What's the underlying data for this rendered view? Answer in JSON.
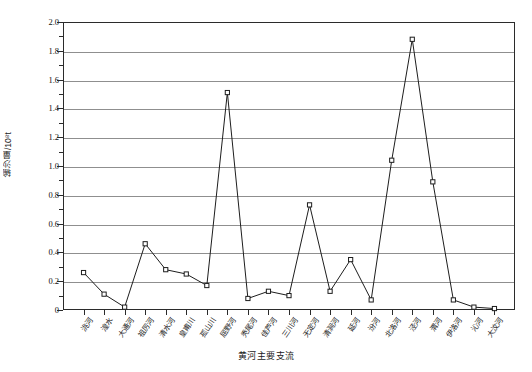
{
  "chart_data": {
    "type": "line",
    "title": "",
    "xlabel": "黄河主要支流",
    "ylabel": "输沙量/10⁸t",
    "ylim": [
      0,
      2.0
    ],
    "yticks": [
      "0",
      "0.2",
      "0.4",
      "0.6",
      "0.8",
      "1.0",
      "1.2",
      "1.4",
      "1.6",
      "1.8",
      "2.0"
    ],
    "ytick_values": [
      0,
      0.2,
      0.4,
      0.6,
      0.8,
      1.0,
      1.2,
      1.4,
      1.6,
      1.8,
      2.0
    ],
    "minor_tick_step": 0.1,
    "grid": true,
    "grid_axis": "y",
    "legend": "none",
    "marker": "open-square",
    "line_color": "#1d1d1d",
    "categories": [
      "洮河",
      "湟水",
      "大通河",
      "祖厉河",
      "清水河",
      "皇甫川",
      "孤山川",
      "屈野河",
      "秃尾河",
      "佳芦河",
      "三川河",
      "无定河",
      "清涧河",
      "延河",
      "汾河",
      "北洛河",
      "泾河",
      "渭河",
      "伊洛河",
      "沁河",
      "大汶河"
    ],
    "values": [
      0.26,
      0.11,
      0.02,
      0.46,
      0.28,
      0.25,
      0.17,
      1.51,
      0.08,
      0.13,
      0.1,
      0.73,
      0.13,
      0.35,
      0.07,
      1.04,
      1.88,
      0.89,
      0.07,
      0.02,
      0.01
    ]
  }
}
